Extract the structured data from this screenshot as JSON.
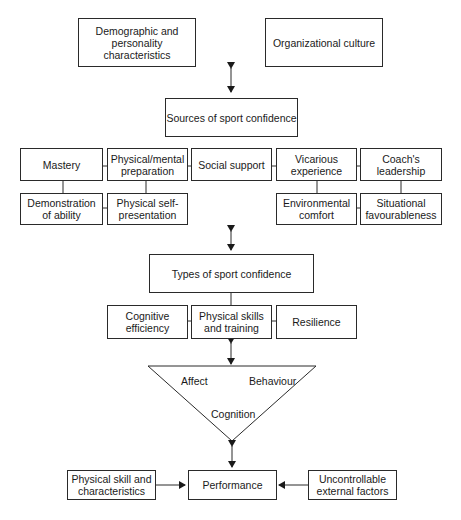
{
  "diagram": {
    "top": {
      "demographic": "Demographic and personality characteristics",
      "demographic_l1": "Demographic and",
      "demographic_l2": "personality characteristics",
      "organizational": "Organizational culture"
    },
    "sources": {
      "title": "Sources of sport confidence",
      "row1": [
        {
          "l1": "Mastery",
          "l2": ""
        },
        {
          "l1": "Physical/mental",
          "l2": "preparation"
        },
        {
          "l1": "Social support",
          "l2": ""
        },
        {
          "l1": "Vicarious",
          "l2": "experience"
        },
        {
          "l1": "Coach's",
          "l2": "leadership"
        }
      ],
      "row2": [
        {
          "l1": "Demonstration",
          "l2": "of ability"
        },
        {
          "l1": "Physical self-",
          "l2": "presentation"
        },
        {
          "l1": "Environmental",
          "l2": "comfort"
        },
        {
          "l1": "Situational",
          "l2": "favourableness"
        }
      ]
    },
    "types": {
      "title": "Types of sport confidence",
      "items": [
        {
          "l1": "Cognitive",
          "l2": "efficiency"
        },
        {
          "l1": "Physical skills",
          "l2": "and training"
        },
        {
          "l1": "Resilience",
          "l2": ""
        }
      ]
    },
    "triangle": {
      "affect": "Affect",
      "behaviour": "Behaviour",
      "cognition": "Cognition"
    },
    "bottom": {
      "left_l1": "Physical skill and",
      "left_l2": "characteristics",
      "center": "Performance",
      "right_l1": "Uncontrollable",
      "right_l2": "external factors"
    },
    "caption": "Figure ..."
  }
}
